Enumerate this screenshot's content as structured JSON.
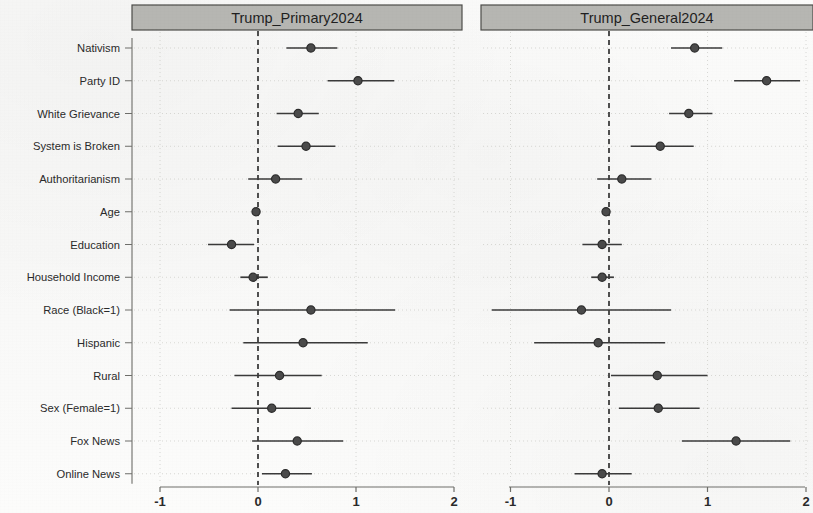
{
  "chart_data": {
    "type": "scatter",
    "plot_kind": "coefficient-forest-plot",
    "panels": [
      {
        "title": "Trump_Primary2024",
        "xlabel": "",
        "ylabel": "",
        "xlim": [
          -1.35,
          2.25
        ],
        "xticks": [
          -1,
          0,
          1,
          2
        ],
        "xticklabels": [
          "-1",
          "0",
          "1",
          "2"
        ],
        "reference_line": 0,
        "reference_line_style": "dashed",
        "grid": true,
        "categories": [
          "Nativism",
          "Party ID",
          "White Grievance",
          "System is Broken",
          "Authoritarianism",
          "Age",
          "Education",
          "Household Income",
          "Race (Black=1)",
          "Hispanic",
          "Rural",
          "Sex (Female=1)",
          "Fox News",
          "Online News"
        ],
        "estimates": [
          0.54,
          1.02,
          0.41,
          0.49,
          0.18,
          -0.02,
          -0.27,
          -0.05,
          0.54,
          0.46,
          0.22,
          0.14,
          0.4,
          0.28
        ],
        "ci_low": [
          0.29,
          0.71,
          0.19,
          0.2,
          -0.1,
          -0.04,
          -0.51,
          -0.18,
          -0.29,
          -0.15,
          -0.24,
          -0.27,
          -0.06,
          0.04
        ],
        "ci_high": [
          0.81,
          1.39,
          0.62,
          0.79,
          0.45,
          0.01,
          -0.04,
          0.1,
          1.4,
          1.12,
          0.65,
          0.54,
          0.87,
          0.55
        ]
      },
      {
        "title": "Trump_General2024",
        "xlabel": "",
        "ylabel": "",
        "xlim": [
          -1.35,
          2.08
        ],
        "xticks": [
          -1,
          0,
          1,
          2
        ],
        "xticklabels": [
          "-1",
          "0",
          "1",
          "2"
        ],
        "reference_line": 0,
        "reference_line_style": "dashed",
        "grid": true,
        "categories": [
          "Nativism",
          "Party ID",
          "White Grievance",
          "System is Broken",
          "Authoritarianism",
          "Age",
          "Education",
          "Household Income",
          "Race (Black=1)",
          "Hispanic",
          "Rural",
          "Sex (Female=1)",
          "Fox News",
          "Online News"
        ],
        "estimates": [
          0.87,
          1.6,
          0.81,
          0.52,
          0.13,
          -0.03,
          -0.07,
          -0.07,
          -0.28,
          -0.11,
          0.49,
          0.5,
          1.29,
          -0.07
        ],
        "ci_low": [
          0.63,
          1.27,
          0.61,
          0.22,
          -0.12,
          -0.05,
          -0.27,
          -0.18,
          -1.19,
          -0.76,
          0.02,
          0.1,
          0.74,
          -0.35
        ],
        "ci_high": [
          1.15,
          1.94,
          1.05,
          0.86,
          0.43,
          -0.01,
          0.13,
          0.05,
          0.63,
          0.57,
          1.0,
          0.92,
          1.84,
          0.23
        ]
      }
    ],
    "colors": {
      "point": "#4a4a4a",
      "point_edge": "#2b2b2b",
      "whisker": "#3a3a3a",
      "reference_line": "#3d3d3d",
      "grid": "#c9c9c4",
      "axis": "#6e6e6a",
      "strip_fill": "#b6b6b2",
      "strip_border": "#4d4d4a",
      "text": "#2a2a2a"
    }
  }
}
